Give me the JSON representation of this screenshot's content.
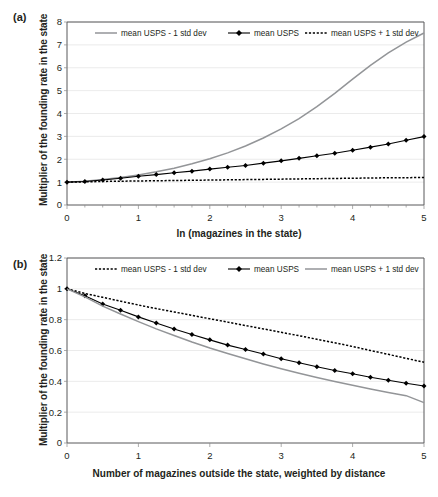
{
  "figure": {
    "panels": [
      {
        "id": "a",
        "label": "(a)",
        "ylabel": "Multiplier of the founding rate in the state",
        "xlabel": "ln (magazines in the state)",
        "legend": [
          {
            "label": "mean USPS - 1 std dev",
            "style": "solid-gray"
          },
          {
            "label": "mean USPS",
            "style": "marker-line"
          },
          {
            "label": "mean USPS + 1 std dev",
            "style": "dotted"
          }
        ]
      },
      {
        "id": "b",
        "label": "(b)",
        "ylabel": "Multiplier of  the founding rate in the state",
        "xlabel": "Number of  magazines outside the state, weighted by distance",
        "legend": [
          {
            "label": "mean USPS - 1 std dev",
            "style": "dotted"
          },
          {
            "label": "mean USPS",
            "style": "marker-line"
          },
          {
            "label": "mean USPS + 1 std dev",
            "style": "solid-gray"
          }
        ]
      }
    ]
  },
  "chart_data": [
    {
      "type": "line",
      "panel": "a",
      "title": "",
      "xlabel": "ln (magazines in the state)",
      "ylabel": "Multiplier of the founding rate in the state",
      "xlim": [
        0,
        5
      ],
      "ylim": [
        0,
        8
      ],
      "xticks": [
        0,
        1,
        2,
        3,
        4,
        5
      ],
      "xticklabels": [
        "0",
        "1",
        "2",
        "3",
        "4",
        "5"
      ],
      "xminorticks": [
        0.25,
        0.5,
        0.75,
        1.25,
        1.5,
        1.75,
        2.25,
        2.5,
        2.75,
        3.25,
        3.5,
        3.75,
        4.25,
        4.5,
        4.75
      ],
      "yticks": [
        0,
        1,
        2,
        3,
        4,
        5,
        6,
        7,
        8
      ],
      "yticklabels": [
        "0",
        "1",
        "2",
        "3",
        "4",
        "5",
        "6",
        "7",
        "8"
      ],
      "grid": "y",
      "legend_position": "top-inside",
      "x": [
        0,
        0.25,
        0.5,
        0.75,
        1,
        1.25,
        1.5,
        1.75,
        2,
        2.25,
        2.5,
        2.75,
        3,
        3.25,
        3.5,
        3.75,
        4,
        4.25,
        4.5,
        4.75,
        5
      ],
      "series": [
        {
          "name": "mean USPS - 1 std dev",
          "style": "solid-gray",
          "color": "#939598",
          "markers": false,
          "values": [
            1.0,
            1.04,
            1.11,
            1.2,
            1.31,
            1.45,
            1.61,
            1.8,
            2.02,
            2.28,
            2.58,
            2.93,
            3.33,
            3.78,
            4.3,
            4.88,
            5.5,
            6.1,
            6.65,
            7.12,
            7.52
          ]
        },
        {
          "name": "mean USPS",
          "style": "marker-line",
          "color": "#000000",
          "markers": true,
          "values": [
            1.0,
            1.03,
            1.09,
            1.17,
            1.26,
            1.33,
            1.41,
            1.48,
            1.57,
            1.65,
            1.73,
            1.83,
            1.93,
            2.04,
            2.15,
            2.26,
            2.39,
            2.53,
            2.67,
            2.83,
            2.99
          ]
        },
        {
          "name": "mean USPS + 1 std dev",
          "style": "dotted",
          "color": "#000000",
          "markers": false,
          "values": [
            1.0,
            1.01,
            1.03,
            1.04,
            1.05,
            1.06,
            1.07,
            1.08,
            1.09,
            1.1,
            1.11,
            1.12,
            1.13,
            1.14,
            1.15,
            1.16,
            1.17,
            1.18,
            1.19,
            1.195,
            1.2
          ]
        }
      ]
    },
    {
      "type": "line",
      "panel": "b",
      "title": "",
      "xlabel": "Number of magazines outside the state, weighted by distance",
      "ylabel": "Multiplier of the founding rate in the state",
      "xlim": [
        0,
        5
      ],
      "ylim": [
        0,
        1.2
      ],
      "xticks": [
        0,
        1,
        2,
        3,
        4,
        5
      ],
      "xticklabels": [
        "0",
        "1",
        "2",
        "3",
        "4",
        "5"
      ],
      "xminorticks": [],
      "yticks": [
        0,
        0.2,
        0.4,
        0.6,
        0.8,
        1,
        1.2
      ],
      "yticklabels": [
        "0",
        "0.2",
        "0.4",
        "0.6",
        "0.8",
        "1",
        "1.2"
      ],
      "grid": "y",
      "legend_position": "top-inside",
      "x": [
        0,
        0.25,
        0.5,
        0.75,
        1,
        1.25,
        1.5,
        1.75,
        2,
        2.25,
        2.5,
        2.75,
        3,
        3.25,
        3.5,
        3.75,
        4,
        4.25,
        4.5,
        4.75,
        5
      ],
      "series": [
        {
          "name": "mean USPS - 1 std dev",
          "style": "dotted",
          "color": "#000000",
          "markers": false,
          "values": [
            1.0,
            0.97,
            0.945,
            0.92,
            0.895,
            0.872,
            0.85,
            0.828,
            0.806,
            0.784,
            0.762,
            0.74,
            0.718,
            0.696,
            0.673,
            0.65,
            0.626,
            0.6,
            0.575,
            0.549,
            0.524
          ]
        },
        {
          "name": "mean USPS",
          "style": "marker-line",
          "color": "#000000",
          "markers": true,
          "values": [
            1.0,
            0.955,
            0.902,
            0.861,
            0.818,
            0.779,
            0.739,
            0.704,
            0.669,
            0.635,
            0.606,
            0.577,
            0.546,
            0.521,
            0.495,
            0.47,
            0.449,
            0.427,
            0.407,
            0.388,
            0.37
          ]
        },
        {
          "name": "mean USPS + 1 std dev",
          "style": "solid-gray",
          "color": "#939598",
          "markers": false,
          "values": [
            1.0,
            0.948,
            0.888,
            0.837,
            0.787,
            0.74,
            0.697,
            0.655,
            0.616,
            0.58,
            0.546,
            0.513,
            0.482,
            0.453,
            0.425,
            0.399,
            0.374,
            0.35,
            0.328,
            0.307,
            0.262
          ]
        }
      ]
    }
  ]
}
